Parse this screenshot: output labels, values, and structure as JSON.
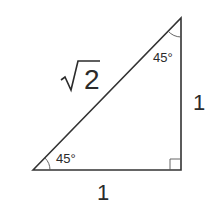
{
  "diagram": {
    "hypotenuse_label": {
      "radical": "√",
      "value": "2"
    },
    "vertical_leg_label": "1",
    "horizontal_leg_label": "1",
    "top_angle_label": "45°",
    "bottom_angle_label": "45°",
    "stroke_color": "#333333",
    "background": "#ffffff"
  }
}
